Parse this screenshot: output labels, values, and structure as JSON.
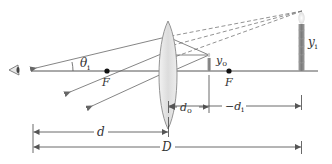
{
  "diagram": {
    "colors": {
      "line": "#555555",
      "dashed": "#777777",
      "lens_fill": "#e6e6e6",
      "lens_stroke": "#888888",
      "candle": "#8a8a8a",
      "text": "#333333"
    },
    "labels": {
      "theta": "θ",
      "theta_sub": "i",
      "focal_left": "F",
      "focal_right": "F",
      "object_height": "y",
      "object_height_sub": "o",
      "image_height": "y",
      "image_height_sub": "i",
      "object_distance": "d",
      "object_distance_sub": "o",
      "image_distance": "−d",
      "image_distance_sub": "i",
      "eye_to_lens": "d",
      "eye_to_image": "D"
    }
  }
}
